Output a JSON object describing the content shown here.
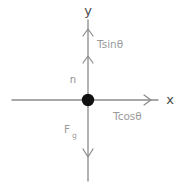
{
  "diagram": {
    "type": "force-diagram",
    "background_color": "#ffffff",
    "axis_color": "#8a8a8a",
    "label_color": "#9a9a9a",
    "axis_label_color": "#4a4a4a",
    "origin_dot_color": "#111111",
    "axes": {
      "y_label": "y",
      "x_label": "x"
    },
    "origin": {
      "name": "origin-point",
      "x": 88,
      "y": 100
    },
    "vectors": [
      {
        "id": "tension-vertical",
        "label": "Tsinθ",
        "direction": "up",
        "along": "y-axis",
        "tip_x": 88,
        "tip_y": 30,
        "label_x": 97,
        "label_y": 48
      },
      {
        "id": "normal-force",
        "label": "n",
        "direction": "up",
        "along": "y-axis",
        "tip_x": 88,
        "tip_y": 57,
        "label_x": 73,
        "label_y": 83
      },
      {
        "id": "tension-horizontal",
        "label": "Tcosθ",
        "direction": "right",
        "along": "x-axis",
        "tip_x": 150,
        "tip_y": 100,
        "label_x": 113,
        "label_y": 120
      },
      {
        "id": "gravity-force",
        "label": "F",
        "label_subscript": "g",
        "direction": "down",
        "along": "y-axis",
        "tip_x": 88,
        "tip_y": 156,
        "label_x": 64,
        "label_y": 133
      }
    ]
  }
}
